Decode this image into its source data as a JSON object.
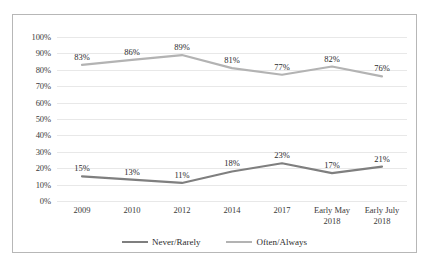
{
  "chart_data": {
    "type": "line",
    "title": "",
    "subtitle": "",
    "xlabel": "",
    "ylabel": "",
    "ylim": [
      0,
      100
    ],
    "grid": true,
    "legend_position": "bottom",
    "categories": [
      "2009",
      "2010",
      "2012",
      "2014",
      "2017",
      "Early May 2018",
      "Early July 2018"
    ],
    "category_lines": [
      [
        "2009"
      ],
      [
        "2010"
      ],
      [
        "2012"
      ],
      [
        "2014"
      ],
      [
        "2017"
      ],
      [
        "Early May",
        "2018"
      ],
      [
        "Early July",
        "2018"
      ]
    ],
    "y_ticks": [
      "0%",
      "10%",
      "20%",
      "30%",
      "40%",
      "50%",
      "60%",
      "70%",
      "80%",
      "90%",
      "100%"
    ],
    "y_tick_values": [
      0,
      10,
      20,
      30,
      40,
      50,
      60,
      70,
      80,
      90,
      100
    ],
    "series": [
      {
        "name": "Never/Rarely",
        "color": "#7f7f7f",
        "values": [
          15,
          13,
          11,
          18,
          23,
          17,
          21
        ],
        "labels": [
          "15%",
          "13%",
          "11%",
          "18%",
          "23%",
          "17%",
          "21%"
        ]
      },
      {
        "name": "Often/Always",
        "color": "#b3b3b3",
        "values": [
          83,
          86,
          89,
          81,
          77,
          82,
          76
        ],
        "labels": [
          "83%",
          "86%",
          "89%",
          "81%",
          "77%",
          "82%",
          "76%"
        ]
      }
    ]
  },
  "legend": {
    "items": [
      {
        "label": "Never/Rarely",
        "color": "#7f7f7f"
      },
      {
        "label": "Often/Always",
        "color": "#b3b3b3"
      }
    ]
  },
  "colors": {
    "never_rarely": "#7f7f7f",
    "often_always": "#b3b3b3",
    "gridline": "#e8e8e8",
    "border": "#b7b7b7",
    "text": "#2b2b2b"
  }
}
